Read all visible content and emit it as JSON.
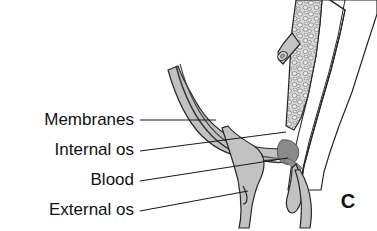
{
  "figure": {
    "panel_letter": "C",
    "background_color": "#ffffff"
  },
  "labels": [
    {
      "id": "membranes",
      "text": "Membranes",
      "text_x": 134,
      "text_y": 121,
      "leader_points": "140,120 216,120",
      "icon": "leader-line"
    },
    {
      "id": "internal-os",
      "text": "Internal os",
      "text_x": 134,
      "text_y": 151,
      "leader_points": "140,151 286,132",
      "icon": "leader-line"
    },
    {
      "id": "blood",
      "text": "Blood",
      "text_x": 134,
      "text_y": 181,
      "leader_points": "140,181 288,158",
      "icon": "leader-line"
    },
    {
      "id": "external-os",
      "text": "External os",
      "text_x": 134,
      "text_y": 211,
      "leader_points": "140,211 248,191",
      "icon": "leader-line"
    }
  ],
  "anatomy": {
    "colors": {
      "wall_fill": "#b9b9b9",
      "wall_fill_light": "#c9c9c9",
      "placenta_fill": "#d2d2d2",
      "placenta_cell": "#e8e8e8",
      "blood_fill": "#8a8a8a",
      "canal_fill": "#ffffff",
      "outline": "#262626",
      "membrane_line": "#333333",
      "vessel_fill": "#c4c4c4"
    },
    "parts": [
      {
        "id": "uterine-wall-right",
        "name": "right uterine wall band"
      },
      {
        "id": "uterine-wall-left",
        "name": "left lower uterine segment"
      },
      {
        "id": "placenta",
        "name": "placental tissue with villous texture"
      },
      {
        "id": "vessel-stub",
        "name": "cut umbilical vessel stub"
      },
      {
        "id": "membranes-curve",
        "name": "fetal membranes double line"
      },
      {
        "id": "cervical-lip-anterior",
        "name": "anterior cervical lip"
      },
      {
        "id": "cervical-lip-posterior",
        "name": "posterior cervical lip"
      },
      {
        "id": "blood-collection",
        "name": "blood at internal os"
      },
      {
        "id": "external-os-notch",
        "name": "external os opening"
      }
    ]
  }
}
